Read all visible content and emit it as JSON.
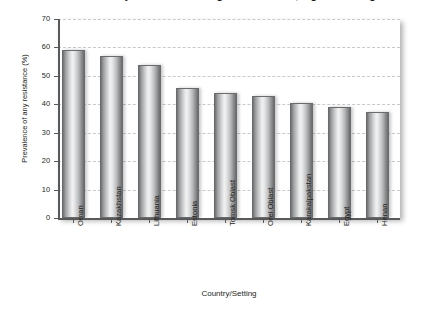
{
  "chart_data": {
    "type": "bar",
    "title": "Prevalence of any resistance among new TB cases, highest settings",
    "xlabel": "Country/Setting",
    "ylabel": "Prevalence of any resistance (%)",
    "categories": [
      "Oman",
      "Kazakhstan",
      "Lithuania",
      "Estonia",
      "Tomsk Oblast",
      "Orel Oblast",
      "Karakalpakstan",
      "Egypt",
      "Henan"
    ],
    "values": [
      59.0,
      57.0,
      54.0,
      45.8,
      44.0,
      43.0,
      40.6,
      38.9,
      37.3
    ],
    "ylim": [
      0,
      70
    ],
    "yticks": [
      0,
      10,
      20,
      30,
      40,
      50,
      60,
      70
    ],
    "ytick_labels": [
      "0",
      "10",
      "20",
      "30",
      "40",
      "50",
      "60",
      "70"
    ],
    "grid": true,
    "grid_axis": "y",
    "grid_style": "dashed",
    "legend": "none",
    "bar_fill": "#d3d4d5",
    "bar_edge": "#6a6b6d",
    "grid_color": "#c9c9c9",
    "axis_color": "#58595b",
    "text_color": "#231f20",
    "background": "#ffffff"
  }
}
